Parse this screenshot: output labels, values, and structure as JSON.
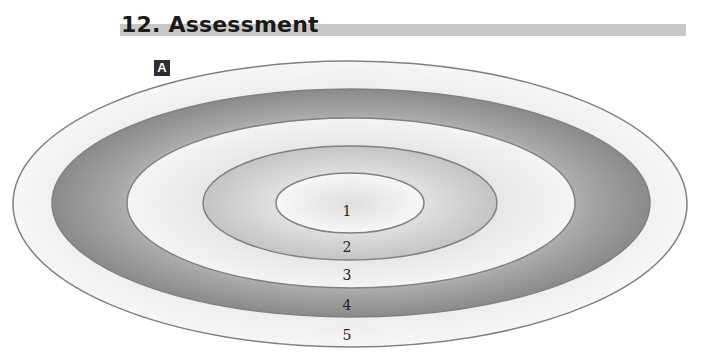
{
  "header": {
    "title": "12.  Assessment",
    "bar_color": "#c8c8c8"
  },
  "panel": {
    "label": "A"
  },
  "diagram": {
    "type": "concentric-ellipses",
    "center": {
      "x": 350,
      "y": 204
    },
    "rings": [
      {
        "number": "5",
        "label": "5",
        "rx": 337,
        "ry": 143,
        "shade": "light",
        "fill": "#ececec"
      },
      {
        "number": "4",
        "label": "4",
        "rx": 299,
        "ry": 114,
        "shade": "dark",
        "fill": "#9a9a9a"
      },
      {
        "number": "3",
        "label": "3",
        "rx": 224,
        "ry": 85,
        "shade": "light",
        "fill": "#eeeeee"
      },
      {
        "number": "2",
        "label": "2",
        "rx": 147,
        "ry": 57,
        "shade": "medium",
        "fill": "#d2d2d2"
      },
      {
        "number": "1",
        "label": "1",
        "rx": 74,
        "ry": 30,
        "shade": "lightest",
        "fill": "#f2f2f2"
      }
    ],
    "stroke_color": "#808080"
  }
}
